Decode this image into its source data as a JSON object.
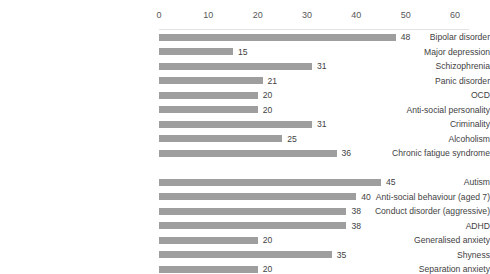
{
  "chart_data": {
    "type": "bar",
    "orientation": "horizontal",
    "title": "",
    "subtitle": "",
    "xlabel": "",
    "ylabel": "",
    "xlim": [
      0,
      60
    ],
    "axis_position": "top",
    "grid": false,
    "legend": null,
    "bar_color": "#9e9e9e",
    "label_color": "#3f3f3f",
    "tick_color": "#575757",
    "axis_line_color": "#e2e2e2",
    "tick_labels": [
      "0",
      "10",
      "20",
      "30",
      "40",
      "50",
      "60"
    ],
    "tick_values": [
      0,
      10,
      20,
      30,
      40,
      50,
      60
    ],
    "categories": [
      "Bipolar disorder",
      "Major depression",
      "Schizophrenia",
      "Panic disorder",
      "OCD",
      "Anti-social personality",
      "Criminality",
      "Alcoholism",
      "Chronic fatigue syndrome",
      "",
      "Autism",
      "Anti-social behaviour (aged 7)",
      "Conduct disorder (aggressive)",
      "ADHD",
      "Generalised anxiety",
      "Shyness",
      "Separation anxiety"
    ],
    "values": [
      48,
      15,
      31,
      21,
      20,
      20,
      31,
      25,
      36,
      null,
      45,
      40,
      38,
      38,
      20,
      35,
      20
    ],
    "data_labels": [
      "48",
      "15",
      "31",
      "21",
      "20",
      "20",
      "31",
      "25",
      "36",
      "",
      "45",
      "40",
      "38",
      "38",
      "20",
      "35",
      "20"
    ]
  }
}
